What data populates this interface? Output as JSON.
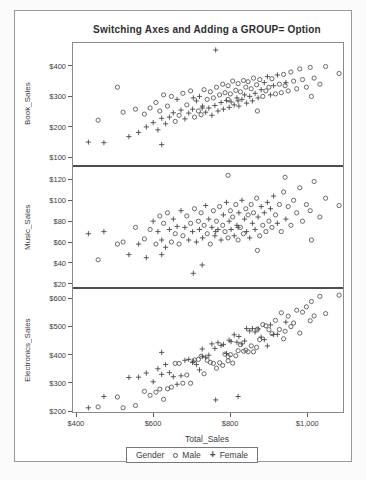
{
  "chart_data": {
    "type": "scatter",
    "title": "Switching Axes and Adding a GROUP= Option",
    "xlabel": "Total_Sales",
    "grid": "off",
    "legend_position": "bottom",
    "colors": {
      "marker_male": "#5a5a5a",
      "marker_female": "#484848",
      "axis_line": "#8a8a8a",
      "panel_divider": "#4d4d4d",
      "text": "#3c3c3c"
    },
    "x_axis": {
      "lim": [
        390,
        1090
      ],
      "ticks": [
        {
          "value": 400,
          "label": "$400"
        },
        {
          "value": 600,
          "label": "$600"
        },
        {
          "value": 800,
          "label": "$800"
        },
        {
          "value": 1000,
          "label": "$1,000"
        }
      ]
    },
    "legend": {
      "title": "Gender",
      "entries": [
        {
          "marker": "circle",
          "label": "Male"
        },
        {
          "marker": "plus",
          "label": "Female"
        }
      ]
    },
    "panels": [
      {
        "ylabel": "Book_Sales",
        "lim": [
          75,
          475
        ],
        "ticks": [
          {
            "value": 100,
            "label": "$100"
          },
          {
            "value": 200,
            "label": "$200"
          },
          {
            "value": 300,
            "label": "$300"
          },
          {
            "value": 400,
            "label": "$400"
          }
        ]
      },
      {
        "ylabel": "Music_Sales",
        "lim": [
          15,
          130
        ],
        "ticks": [
          {
            "value": 20,
            "label": "$20"
          },
          {
            "value": 40,
            "label": "$40"
          },
          {
            "value": 60,
            "label": "$60"
          },
          {
            "value": 80,
            "label": "$80"
          },
          {
            "value": 100,
            "label": "$100"
          },
          {
            "value": 120,
            "label": "$120"
          }
        ]
      },
      {
        "ylabel": "Electronics_Sales",
        "lim": [
          190,
          625
        ],
        "ticks": [
          {
            "value": 200,
            "label": "$200"
          },
          {
            "value": 300,
            "label": "$300"
          },
          {
            "value": 400,
            "label": "$400"
          },
          {
            "value": 500,
            "label": "$500"
          },
          {
            "value": 600,
            "label": "$600"
          }
        ]
      }
    ],
    "record_fields": [
      "Total_Sales",
      "Book_Sales",
      "Music_Sales",
      "Electronics_Sales",
      "Gender"
    ],
    "records": [
      [
        430,
        150,
        68,
        212,
        "F"
      ],
      [
        455,
        222,
        43,
        215,
        "M"
      ],
      [
        470,
        148,
        70,
        252,
        "F"
      ],
      [
        505,
        330,
        58,
        250,
        "M"
      ],
      [
        520,
        248,
        60,
        212,
        "M"
      ],
      [
        535,
        168,
        48,
        319,
        "F"
      ],
      [
        552,
        258,
        74,
        220,
        "M"
      ],
      [
        560,
        182,
        58,
        320,
        "F"
      ],
      [
        575,
        242,
        63,
        270,
        "M"
      ],
      [
        580,
        200,
        45,
        335,
        "F"
      ],
      [
        590,
        262,
        72,
        256,
        "M"
      ],
      [
        598,
        214,
        80,
        304,
        "F"
      ],
      [
        605,
        280,
        58,
        267,
        "M"
      ],
      [
        610,
        190,
        70,
        350,
        "F"
      ],
      [
        615,
        252,
        85,
        278,
        "M"
      ],
      [
        620,
        142,
        48,
        408,
        "F"
      ],
      [
        620,
        228,
        62,
        330,
        "F"
      ],
      [
        625,
        305,
        78,
        242,
        "M"
      ],
      [
        630,
        210,
        55,
        365,
        "F"
      ],
      [
        635,
        268,
        88,
        279,
        "M"
      ],
      [
        640,
        232,
        72,
        336,
        "F"
      ],
      [
        645,
        300,
        60,
        285,
        "M"
      ],
      [
        650,
        246,
        82,
        322,
        "F"
      ],
      [
        655,
        218,
        68,
        369,
        "M"
      ],
      [
        660,
        290,
        75,
        295,
        "F"
      ],
      [
        665,
        238,
        58,
        369,
        "M"
      ],
      [
        670,
        255,
        90,
        325,
        "F"
      ],
      [
        675,
        310,
        66,
        299,
        "M"
      ],
      [
        680,
        226,
        74,
        380,
        "F"
      ],
      [
        685,
        272,
        85,
        328,
        "M"
      ],
      [
        690,
        245,
        62,
        383,
        "F"
      ],
      [
        695,
        318,
        78,
        299,
        "M"
      ],
      [
        700,
        258,
        70,
        372,
        "F"
      ],
      [
        702,
        295,
        30,
        377,
        "F"
      ],
      [
        705,
        232,
        92,
        381,
        "M"
      ],
      [
        710,
        285,
        60,
        365,
        "F"
      ],
      [
        715,
        252,
        80,
        383,
        "M"
      ],
      [
        718,
        300,
        72,
        346,
        "F"
      ],
      [
        722,
        240,
        88,
        394,
        "M"
      ],
      [
        725,
        262,
        38,
        420,
        "F"
      ],
      [
        726,
        268,
        64,
        394,
        "F"
      ],
      [
        730,
        322,
        76,
        332,
        "M"
      ],
      [
        734,
        248,
        95,
        391,
        "F"
      ],
      [
        738,
        290,
        68,
        380,
        "M"
      ],
      [
        742,
        262,
        82,
        398,
        "F"
      ],
      [
        746,
        315,
        58,
        373,
        "M"
      ],
      [
        750,
        238,
        74,
        438,
        "F"
      ],
      [
        754,
        295,
        90,
        369,
        "M"
      ],
      [
        758,
        270,
        66,
        422,
        "F"
      ],
      [
        760,
        452,
        70,
        240,
        "F"
      ],
      [
        762,
        330,
        80,
        352,
        "M"
      ],
      [
        766,
        252,
        72,
        442,
        "F"
      ],
      [
        770,
        305,
        94,
        371,
        "M"
      ],
      [
        774,
        280,
        62,
        432,
        "F"
      ],
      [
        778,
        340,
        76,
        362,
        "M"
      ],
      [
        780,
        258,
        86,
        436,
        "F"
      ],
      [
        784,
        312,
        70,
        402,
        "M"
      ],
      [
        788,
        286,
        98,
        404,
        "F"
      ],
      [
        792,
        290,
        124,
        378,
        "M"
      ],
      [
        792,
        335,
        64,
        393,
        "M"
      ],
      [
        795,
        264,
        80,
        451,
        "F"
      ],
      [
        798,
        308,
        90,
        400,
        "M"
      ],
      [
        800,
        282,
        72,
        446,
        "F"
      ],
      [
        804,
        350,
        84,
        370,
        "M"
      ],
      [
        808,
        272,
        66,
        470,
        "F"
      ],
      [
        812,
        320,
        96,
        396,
        "M"
      ],
      [
        815,
        295,
        76,
        444,
        "F"
      ],
      [
        818,
        285,
        74,
        252,
        "F"
      ],
      [
        818,
        342,
        62,
        414,
        "M"
      ],
      [
        820,
        268,
        88,
        464,
        "F"
      ],
      [
        824,
        315,
        74,
        435,
        "M"
      ],
      [
        828,
        290,
        100,
        438,
        "F"
      ],
      [
        832,
        352,
        68,
        412,
        "M"
      ],
      [
        835,
        305,
        82,
        448,
        "F"
      ],
      [
        838,
        330,
        92,
        416,
        "M"
      ],
      [
        840,
        278,
        70,
        492,
        "F"
      ],
      [
        844,
        348,
        86,
        410,
        "M"
      ],
      [
        848,
        300,
        64,
        484,
        "F"
      ],
      [
        852,
        325,
        96,
        431,
        "M"
      ],
      [
        855,
        285,
        78,
        492,
        "F"
      ],
      [
        858,
        360,
        88,
        410,
        "M"
      ],
      [
        862,
        310,
        72,
        480,
        "F"
      ],
      [
        866,
        338,
        102,
        426,
        "M"
      ],
      [
        868,
        252,
        52,
        490,
        "M"
      ],
      [
        870,
        295,
        84,
        491,
        "F"
      ],
      [
        874,
        355,
        66,
        453,
        "M"
      ],
      [
        878,
        322,
        94,
        462,
        "F"
      ],
      [
        882,
        300,
        76,
        506,
        "M"
      ],
      [
        886,
        345,
        88,
        453,
        "F"
      ],
      [
        890,
        318,
        70,
        502,
        "M"
      ],
      [
        894,
        365,
        98,
        431,
        "F"
      ],
      [
        898,
        330,
        80,
        488,
        "M"
      ],
      [
        902,
        305,
        92,
        505,
        "F"
      ],
      [
        906,
        358,
        74,
        474,
        "M"
      ],
      [
        910,
        335,
        104,
        471,
        "F"
      ],
      [
        915,
        308,
        86,
        521,
        "M"
      ],
      [
        920,
        370,
        78,
        472,
        "F"
      ],
      [
        925,
        340,
        96,
        489,
        "M"
      ],
      [
        930,
        312,
        70,
        548,
        "M"
      ],
      [
        936,
        372,
        108,
        456,
        "M"
      ],
      [
        940,
        335,
        122,
        483,
        "M"
      ],
      [
        942,
        345,
        82,
        515,
        "F"
      ],
      [
        948,
        318,
        94,
        536,
        "M"
      ],
      [
        955,
        380,
        76,
        499,
        "M"
      ],
      [
        962,
        350,
        100,
        512,
        "M"
      ],
      [
        970,
        325,
        88,
        557,
        "M"
      ],
      [
        978,
        390,
        112,
        476,
        "M"
      ],
      [
        985,
        355,
        80,
        550,
        "M"
      ],
      [
        995,
        330,
        96,
        569,
        "M"
      ],
      [
        1005,
        395,
        90,
        520,
        "M"
      ],
      [
        1008,
        300,
        62,
        588,
        "M"
      ],
      [
        1015,
        360,
        118,
        537,
        "M"
      ],
      [
        1030,
        340,
        84,
        606,
        "M"
      ],
      [
        1045,
        398,
        102,
        545,
        "M"
      ],
      [
        1080,
        375,
        95,
        610,
        "M"
      ]
    ]
  }
}
